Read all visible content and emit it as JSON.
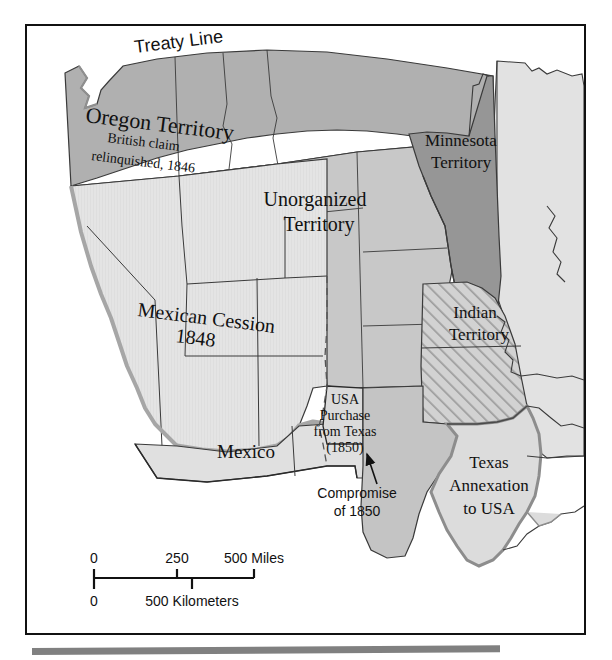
{
  "map": {
    "title_labels": {
      "treaty_line": "Treaty Line",
      "oregon_territory": "Oregon Territory",
      "oregon_sub1": "British claim",
      "oregon_sub2": "relinquished, 1846",
      "minnesota_l1": "Minnesota",
      "minnesota_l2": "Territory",
      "unorganized_l1": "Unorganized",
      "unorganized_l2": "Territory",
      "indian_l1": "Indian",
      "indian_l2": "Territory",
      "mexican_cession_l1": "Mexican Cession",
      "mexican_cession_l2": "1848",
      "mexico": "Mexico",
      "usa_purchase_l1": "USA",
      "usa_purchase_l2": "Purchase",
      "usa_purchase_l3": "from Texas",
      "usa_purchase_l4": "(1850)",
      "compromise_l1": "Compromise",
      "compromise_l2": "of 1850",
      "texas_l1": "Texas",
      "texas_l2": "Annexation",
      "texas_l3": "to USA"
    },
    "scale_bar": {
      "miles_0": "0",
      "miles_250": "250",
      "miles_500": "500 Miles",
      "km_0": "0",
      "km_500": "500 Kilometers"
    },
    "colors": {
      "dark_gray": "#a8a8a8",
      "medium_gray": "#b8b8b8",
      "light_gray": "#dcdcdc",
      "pale_gray": "#e6e6e6",
      "hatch_gray": "#c4c4c4",
      "outline": "#333333",
      "soft_outline": "#9a9a9a",
      "frame": "#111111",
      "rule": "#808080"
    }
  }
}
